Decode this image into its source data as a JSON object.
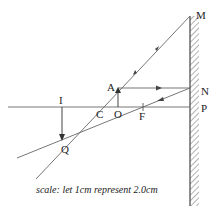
{
  "diagram": {
    "type": "ray-diagram",
    "labels": {
      "M": "M",
      "N": "N",
      "P": "P",
      "A": "A",
      "C": "C",
      "O": "O",
      "F": "F",
      "I": "I",
      "Q": "Q"
    },
    "caption": "scale: let 1cm represent 2.0cm",
    "colors": {
      "line": "#555555",
      "text": "#222222",
      "background": "#ffffff"
    }
  }
}
